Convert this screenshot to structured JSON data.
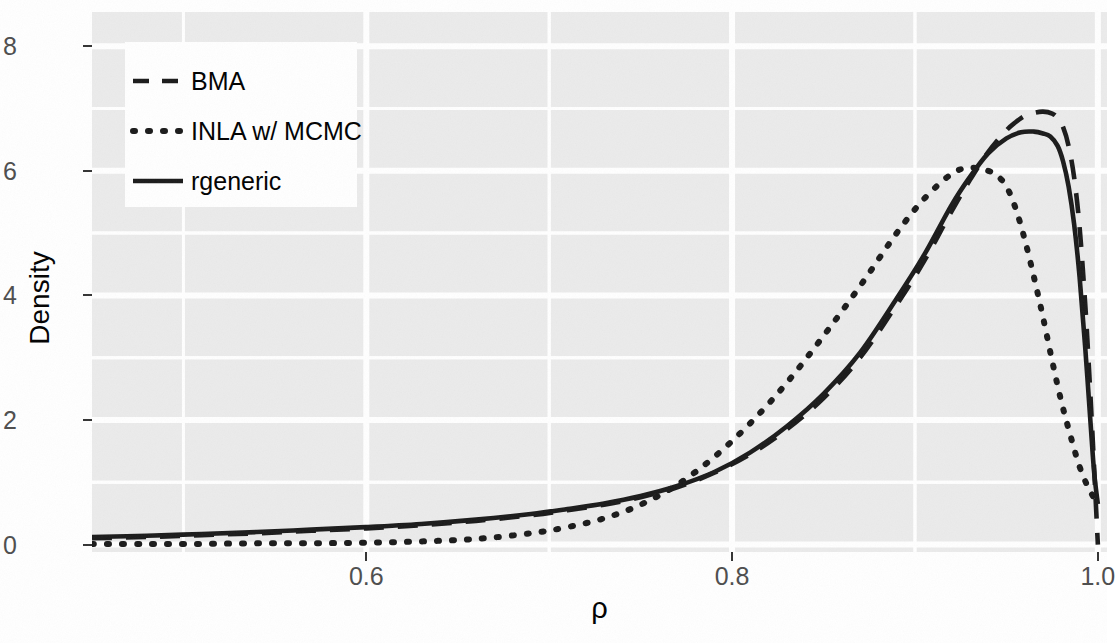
{
  "figure": {
    "background_color": "#ffffff",
    "panel_color": "#ebebeb",
    "grid_color": "#ffffff",
    "line_color": "#1a1a1a"
  },
  "axes": {
    "y_title": "Density",
    "x_title": "ρ",
    "y_ticks": [
      "0",
      "2",
      "4",
      "6",
      "8"
    ],
    "x_ticks": [
      "0.6",
      "0.8",
      "1.0"
    ]
  },
  "legend": {
    "entries": [
      {
        "label": "BMA",
        "dash": "dashed",
        "key": "dashed-line-key"
      },
      {
        "label": "INLA w/ MCMC",
        "dash": "dotted",
        "key": "dotted-line-key"
      },
      {
        "label": "rgeneric",
        "dash": "solid",
        "key": "solid-line-key"
      }
    ]
  },
  "chart_data": {
    "type": "line",
    "title": "",
    "subtitle": "",
    "xlabel": "ρ",
    "ylabel": "Density",
    "xlim": [
      0.45,
      1.005
    ],
    "ylim": [
      -0.12,
      8.55
    ],
    "x_ticks": [
      0.6,
      0.8,
      1.0
    ],
    "y_ticks": [
      0,
      2,
      4,
      6,
      8
    ],
    "grid": true,
    "grid_minor": true,
    "legend_position": "top-left-inside",
    "series": [
      {
        "name": "BMA",
        "style": "dashed",
        "x": [
          0.45,
          0.48,
          0.51,
          0.54,
          0.57,
          0.6,
          0.63,
          0.66,
          0.69,
          0.71,
          0.73,
          0.75,
          0.77,
          0.79,
          0.81,
          0.83,
          0.85,
          0.87,
          0.89,
          0.905,
          0.92,
          0.93,
          0.94,
          0.95,
          0.955,
          0.96,
          0.965,
          0.97,
          0.975,
          0.978,
          0.981,
          0.984,
          0.987,
          0.99,
          0.993,
          0.995,
          0.997,
          0.999,
          1.0
        ],
        "y": [
          0.1,
          0.12,
          0.15,
          0.18,
          0.22,
          0.26,
          0.31,
          0.38,
          0.47,
          0.55,
          0.64,
          0.76,
          0.92,
          1.15,
          1.45,
          1.85,
          2.35,
          3.0,
          3.85,
          4.55,
          5.35,
          5.85,
          6.3,
          6.65,
          6.78,
          6.88,
          6.93,
          6.95,
          6.92,
          6.85,
          6.7,
          6.4,
          5.9,
          5.1,
          3.9,
          2.9,
          1.8,
          0.6,
          0.0
        ]
      },
      {
        "name": "INLA w/ MCMC",
        "style": "dotted",
        "x": [
          0.45,
          0.48,
          0.51,
          0.54,
          0.57,
          0.6,
          0.63,
          0.66,
          0.69,
          0.71,
          0.73,
          0.75,
          0.77,
          0.79,
          0.81,
          0.83,
          0.85,
          0.87,
          0.89,
          0.905,
          0.92,
          0.93,
          0.94,
          0.945,
          0.95,
          0.955,
          0.96,
          0.965,
          0.97,
          0.975,
          0.98,
          0.985,
          0.99,
          0.995,
          1.0
        ],
        "y": [
          0.01,
          0.01,
          0.01,
          0.02,
          0.02,
          0.03,
          0.05,
          0.09,
          0.18,
          0.28,
          0.42,
          0.64,
          0.96,
          1.4,
          1.95,
          2.6,
          3.35,
          4.15,
          5.0,
          5.55,
          5.95,
          6.05,
          6.0,
          5.92,
          5.75,
          5.4,
          4.9,
          4.3,
          3.65,
          2.95,
          2.3,
          1.75,
          1.25,
          0.9,
          0.65
        ]
      },
      {
        "name": "rgeneric",
        "style": "solid",
        "x": [
          0.45,
          0.48,
          0.51,
          0.54,
          0.57,
          0.6,
          0.63,
          0.66,
          0.69,
          0.71,
          0.73,
          0.75,
          0.77,
          0.79,
          0.81,
          0.83,
          0.85,
          0.87,
          0.89,
          0.905,
          0.92,
          0.93,
          0.94,
          0.95,
          0.958,
          0.965,
          0.97,
          0.974,
          0.978,
          0.981,
          0.984,
          0.987,
          0.99,
          0.993,
          0.996,
          0.998,
          1.0
        ],
        "y": [
          0.12,
          0.14,
          0.17,
          0.2,
          0.24,
          0.28,
          0.33,
          0.4,
          0.49,
          0.57,
          0.66,
          0.78,
          0.94,
          1.16,
          1.48,
          1.9,
          2.42,
          3.08,
          3.95,
          4.65,
          5.45,
          5.9,
          6.28,
          6.52,
          6.62,
          6.63,
          6.6,
          6.55,
          6.4,
          6.15,
          5.75,
          5.15,
          4.3,
          3.2,
          1.95,
          1.15,
          0.65
        ]
      }
    ]
  }
}
